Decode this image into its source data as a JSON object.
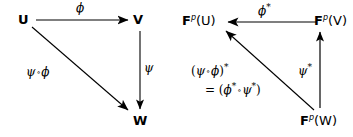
{
  "figure": {
    "type": "commutative-diagram",
    "background_color": "#ffffff",
    "ink_color": "#000000"
  },
  "left_diagram": {
    "nodes": {
      "u": "U",
      "v": "V",
      "w": "W"
    },
    "arrows": {
      "u_to_v": "ϕ",
      "v_to_w": "ψ",
      "u_to_w_part1": "ψ",
      "u_to_w_circ": "∘",
      "u_to_w_part2": "ϕ"
    }
  },
  "right_diagram": {
    "nodes": {
      "fu_base": "F",
      "fu_sup": "p",
      "fu_arg": "(U)",
      "fv_base": "F",
      "fv_sup": "p",
      "fv_arg": "(V)",
      "fw_base": "F",
      "fw_sup": "p",
      "fw_arg": "(W)"
    },
    "arrows": {
      "fv_to_fu": "ϕ",
      "fv_to_fu_star": "*",
      "fw_to_fv": "ψ",
      "fw_to_fv_star": "*"
    },
    "composite_label": {
      "line1_open": "(",
      "line1_psi": "ψ",
      "line1_circ": "∘",
      "line1_phi": "ϕ",
      "line1_close": ")",
      "line1_star": "*",
      "line2_equals": "= (",
      "line2_phi": "ϕ",
      "line2_phi_star": "*",
      "line2_circ": "∘",
      "line2_psi": "ψ",
      "line2_psi_star": "*",
      "line2_close": ")"
    }
  }
}
